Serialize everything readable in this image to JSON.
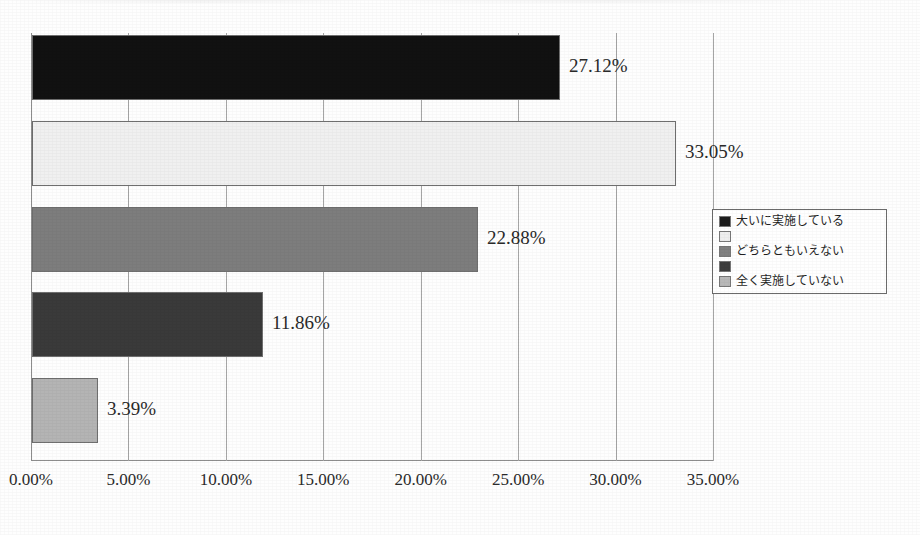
{
  "chart_data": {
    "type": "bar",
    "orientation": "horizontal",
    "title": "",
    "subtitle": "",
    "xlabel": "",
    "ylabel": "",
    "xlim": [
      0,
      35
    ],
    "grid": true,
    "legend_position": "right",
    "categories": [
      "大いに実施している",
      "",
      "どちらともいえない",
      "",
      "全く実施していない"
    ],
    "values": [
      27.12,
      33.05,
      22.88,
      11.86,
      3.39
    ],
    "data_labels": [
      "27.12%",
      "33.05%",
      "22.88%",
      "11.86%",
      "3.39%"
    ],
    "bar_colors": [
      "#111111",
      "#f0f0f0",
      "#7d7d7d",
      "#3a3a3a",
      "#b4b4b4"
    ],
    "xticks": [
      {
        "value": 0,
        "label": "0.00%"
      },
      {
        "value": 5,
        "label": "5.00%"
      },
      {
        "value": 10,
        "label": "10.00%"
      },
      {
        "value": 15,
        "label": "15.00%"
      },
      {
        "value": 20,
        "label": "20.00%"
      },
      {
        "value": 25,
        "label": "25.00%"
      },
      {
        "value": 30,
        "label": "30.00%"
      },
      {
        "value": 35,
        "label": "35.00%"
      }
    ],
    "legend": [
      {
        "label": "大いに実施している",
        "color": "#1c1c1c"
      },
      {
        "label": "",
        "color": "#eeeeee"
      },
      {
        "label": "どちらともいえない",
        "color": "#808080"
      },
      {
        "label": "",
        "color": "#3d3d3d"
      },
      {
        "label": "全く実施していない",
        "color": "#b8b8b8"
      }
    ]
  },
  "axis": {
    "ticks": [
      "0.00%",
      "5.00%",
      "10.00%",
      "15.00%",
      "20.00%",
      "25.00%",
      "30.00%",
      "35.00%"
    ]
  },
  "labels": {
    "bar1": "27.12%",
    "bar2": "33.05%",
    "bar3": "22.88%",
    "bar4": "11.86%",
    "bar5": "3.39%"
  },
  "legend": {
    "item1": "大いに実施している",
    "item2": "",
    "item3": "どちらともいえない",
    "item4": "",
    "item5": "全く実施していない"
  }
}
